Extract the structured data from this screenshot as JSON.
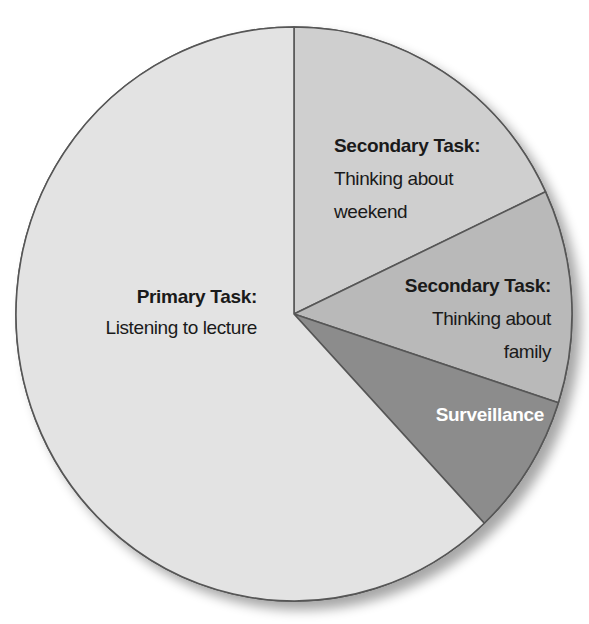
{
  "chart_data": {
    "type": "pie",
    "title": "",
    "start": "12 o'clock",
    "direction": "clockwise",
    "legend": "none (labels inside slices)",
    "slices": [
      {
        "id": "weekend",
        "title": "Secondary Task:",
        "lines": [
          "Thinking about",
          "weekend"
        ],
        "value": 18,
        "color": "#cfcfcf",
        "text_color": "#1a1a1a"
      },
      {
        "id": "family",
        "title": "Secondary Task:",
        "lines": [
          "Thinking about",
          "family"
        ],
        "value": 12,
        "color": "#b9b9b9",
        "text_color": "#1a1a1a"
      },
      {
        "id": "surveillance",
        "title": "Surveillance",
        "lines": [],
        "value": 8,
        "color": "#8c8c8c",
        "text_color": "#ffffff"
      },
      {
        "id": "primary",
        "title": "Primary Task:",
        "lines": [
          "Listening to lecture"
        ],
        "value": 62,
        "color": "#e3e3e3",
        "text_color": "#1a1a1a"
      }
    ],
    "unit": "percent of attention (estimated from slice angles)"
  },
  "style": {
    "border_color": "#575757"
  }
}
